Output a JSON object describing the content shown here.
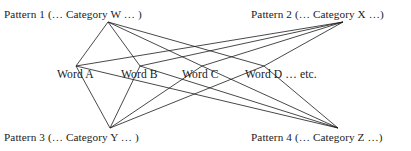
{
  "diagram": {
    "type": "bipartite-graph",
    "background_color": "#ffffff",
    "edge_color": "#1a1a1a",
    "text_color": "#1a1a1a",
    "nodes": {
      "pattern1": {
        "label": "Pattern 1 (… Category W … )",
        "x": 108,
        "y": 22
      },
      "pattern2": {
        "label": "Pattern 2 (… Category X …)",
        "x": 343,
        "y": 22
      },
      "pattern3": {
        "label": "Pattern 3 (… Category Y … )",
        "x": 110,
        "y": 128
      },
      "pattern4": {
        "label": "Pattern 4 (… Category Z …)",
        "x": 338,
        "y": 128
      },
      "wordA": {
        "label": "Word A",
        "x": 76,
        "y": 66
      },
      "wordB": {
        "label": "Word B",
        "x": 140,
        "y": 66
      },
      "wordC": {
        "label": "Word C",
        "x": 202,
        "y": 66
      },
      "wordD": {
        "label": "Word D … etc.",
        "x": 264,
        "y": 66
      }
    },
    "edges": [
      {
        "from": "pattern1",
        "to": "wordA"
      },
      {
        "from": "pattern1",
        "to": "wordB"
      },
      {
        "from": "pattern1",
        "to": "wordC"
      },
      {
        "from": "pattern1",
        "to": "wordD"
      },
      {
        "from": "pattern2",
        "to": "wordA"
      },
      {
        "from": "pattern2",
        "to": "wordB"
      },
      {
        "from": "pattern2",
        "to": "wordC"
      },
      {
        "from": "pattern2",
        "to": "wordD"
      },
      {
        "from": "pattern3",
        "to": "wordA"
      },
      {
        "from": "pattern3",
        "to": "wordB"
      },
      {
        "from": "pattern3",
        "to": "wordC"
      },
      {
        "from": "pattern3",
        "to": "wordD"
      },
      {
        "from": "pattern4",
        "to": "wordA"
      },
      {
        "from": "pattern4",
        "to": "wordB"
      },
      {
        "from": "pattern4",
        "to": "wordC"
      },
      {
        "from": "pattern4",
        "to": "wordD"
      }
    ]
  }
}
